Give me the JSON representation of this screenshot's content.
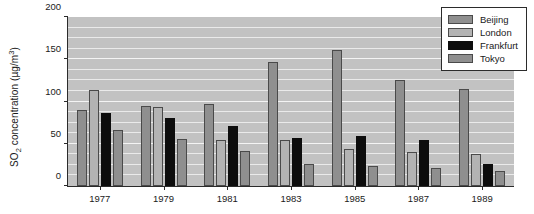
{
  "chart_data": {
    "type": "bar",
    "title": "",
    "xlabel": "",
    "ylabel": "SO2 concentration (ug/m3)",
    "ylabel_parts": {
      "prefix": "SO",
      "subscript": "2",
      "middle": " concentration (µg/m",
      "superscript": "3",
      "suffix": ")"
    },
    "categories": [
      "1977",
      "1979",
      "1981",
      "1983",
      "1985",
      "1987",
      "1989"
    ],
    "series": [
      {
        "name": "Beijing",
        "color": "#8f8f8f",
        "values": [
          90,
          95,
          97,
          147,
          161,
          126,
          115
        ]
      },
      {
        "name": "London",
        "color": "#b3b3b3",
        "values": [
          114,
          93,
          54,
          54,
          44,
          40,
          38
        ]
      },
      {
        "name": "Frankfurt",
        "color": "#0d0d0d",
        "values": [
          86,
          80,
          71,
          57,
          59,
          54,
          26
        ]
      },
      {
        "name": "Tokyo",
        "color": "#8f8f8f",
        "values": [
          66,
          56,
          42,
          26,
          24,
          21,
          18
        ]
      }
    ],
    "ylim": [
      0,
      200
    ],
    "yticks": [
      0,
      50,
      100,
      150,
      200
    ],
    "yticklabels": [
      "0",
      "50",
      "100",
      "150",
      "200"
    ],
    "minor_gridline_step": 12.5,
    "grid": true,
    "grid_axis": "y",
    "legend_position": "upper right",
    "plot_background": "#c2c2c2",
    "figure_background": "#ffffff",
    "axis_color": "#2b2b2b"
  }
}
